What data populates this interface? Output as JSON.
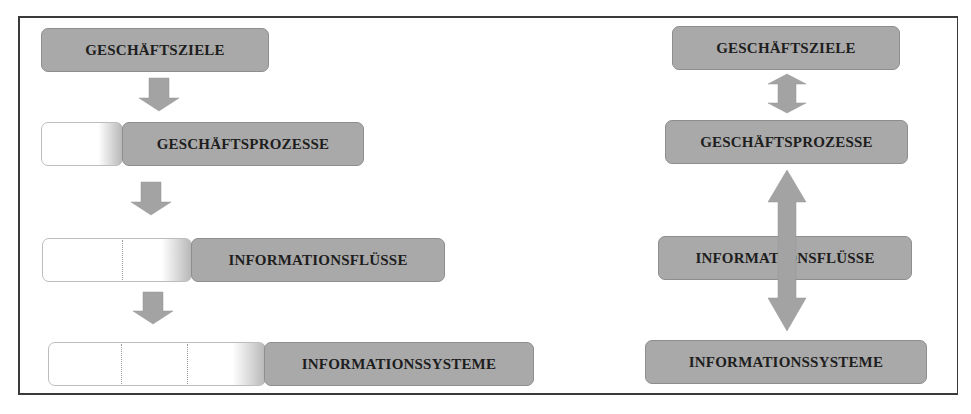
{
  "left_column": {
    "levels": [
      {
        "label": "GESCHÄFTSZIELE",
        "segments": 0
      },
      {
        "label": "GESCHÄFTSPROZESSE",
        "segments": 1
      },
      {
        "label": "INFORMATIONSFLÜSSE",
        "segments": 2
      },
      {
        "label": "INFORMATIONSSYSTEME",
        "segments": 3
      }
    ],
    "arrows": [
      "down",
      "down",
      "down"
    ]
  },
  "right_column": {
    "levels": [
      {
        "label": "GESCHÄFTSZIELE"
      },
      {
        "label": "GESCHÄFTSPROZESSE"
      },
      {
        "label": "INFORMATIONSFLÜSSE"
      },
      {
        "label": "INFORMATIONSSYSTEME"
      }
    ],
    "arrows": [
      "bidirectional-short",
      "bidirectional-long"
    ]
  },
  "colors": {
    "box_fill": "#a9a9a9",
    "text": "#1e1e1e",
    "arrow_fill": "#a3a3a3",
    "frame_border": "#3a3a3a"
  }
}
